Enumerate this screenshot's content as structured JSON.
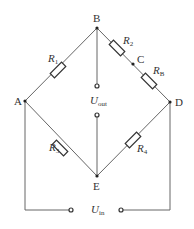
{
  "diagram": {
    "type": "Wheatstone bridge circuit",
    "nodes": {
      "A": "A",
      "B": "B",
      "C": "C",
      "D": "D",
      "E": "E"
    },
    "resistors": {
      "r1": {
        "base": "R",
        "sub": "1"
      },
      "r2": {
        "base": "R",
        "sub": "2"
      },
      "rb": {
        "base": "R",
        "sub": "B"
      },
      "r3": {
        "base": "R",
        "sub": "3"
      },
      "r4": {
        "base": "R",
        "sub": "4"
      }
    },
    "voltages": {
      "out": {
        "base": "U",
        "sub": "out"
      },
      "in": {
        "base": "U",
        "sub": "in"
      }
    }
  }
}
